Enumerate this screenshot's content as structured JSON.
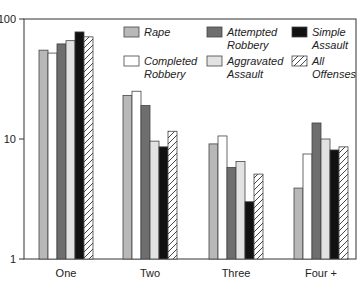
{
  "chart_data": {
    "type": "bar",
    "title": "",
    "xlabel": "",
    "ylabel": "",
    "yscale": "log",
    "ylim": [
      1,
      100
    ],
    "yticks": [
      1,
      10,
      100
    ],
    "ytick_labels": [
      "1",
      "10",
      "100"
    ],
    "grid": false,
    "legend_position": "top-right inside",
    "categories": [
      "One",
      "Two",
      "Three",
      "Four +"
    ],
    "series": [
      {
        "name": "Rape",
        "color": "#b8b8b8",
        "pattern": "solid",
        "values": [
          55,
          23,
          9.1,
          3.9
        ]
      },
      {
        "name": "Completed Robbery",
        "color": "#ffffff",
        "pattern": "solid",
        "values": [
          52,
          25,
          10.6,
          7.5
        ]
      },
      {
        "name": "Attempted Robbery",
        "color": "#6e6e6e",
        "pattern": "solid",
        "values": [
          62,
          19,
          5.8,
          13.6
        ]
      },
      {
        "name": "Aggravated Assault",
        "color": "#e2e2e2",
        "pattern": "solid",
        "values": [
          66,
          9.6,
          6.5,
          10
        ]
      },
      {
        "name": "Simple Assault",
        "color": "#111111",
        "pattern": "solid",
        "values": [
          78,
          8.6,
          3.0,
          8.1
        ]
      },
      {
        "name": "All Offenses",
        "color": "#ffffff",
        "pattern": "hatch",
        "values": [
          71,
          11.6,
          5.1,
          8.6
        ]
      }
    ],
    "legend": [
      {
        "label_lines": [
          "Rape"
        ]
      },
      {
        "label_lines": [
          "Completed",
          "Robbery"
        ]
      },
      {
        "label_lines": [
          "Attempted",
          "Robbery"
        ]
      },
      {
        "label_lines": [
          "Aggravated",
          "Assault"
        ]
      },
      {
        "label_lines": [
          "Simple",
          "Assault"
        ]
      },
      {
        "label_lines": [
          "All",
          "Offenses"
        ]
      }
    ]
  }
}
